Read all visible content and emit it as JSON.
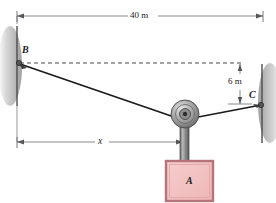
{
  "figure": {
    "background_color": "#ffffff"
  },
  "dimensions": {
    "span": {
      "label": "40 m",
      "orientation": "horizontal",
      "from_point": "B",
      "to_point": "C"
    },
    "drop": {
      "label": "6 m",
      "orientation": "vertical",
      "from_point": "B-level",
      "to_point": "C"
    },
    "distance": {
      "label": "x",
      "orientation": "horizontal",
      "from_point": "B-wall",
      "to_point": "pulley"
    }
  },
  "points": [
    {
      "id": "B",
      "label": "B",
      "anchor": "left-wall"
    },
    {
      "id": "C",
      "label": "C",
      "anchor": "right-wall"
    }
  ],
  "block": {
    "label": "A",
    "fill_color": "#f2bfbf",
    "border_color": "#b5737a"
  },
  "pulley": {
    "name": "pulley-wheel",
    "fill_color": "#a6a6a6"
  },
  "rod": {
    "name": "hanger-rod",
    "fill_color": "#8c8c8c"
  },
  "walls": {
    "left": {
      "name": "left-wall",
      "color": "#4d4d4d"
    },
    "right": {
      "name": "right-wall",
      "color": "#4d4d4d"
    }
  },
  "cables": [
    {
      "name": "cable-b-to-pulley",
      "color": "#1a1a1a"
    },
    {
      "name": "cable-pulley-to-c",
      "color": "#1a1a1a"
    }
  ],
  "reference_line": {
    "name": "horizontal-dashed-reference",
    "style": "dashed",
    "color": "#333333"
  }
}
